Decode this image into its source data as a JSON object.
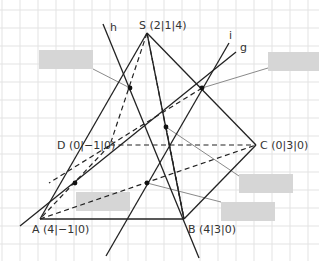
{
  "diagram": {
    "points": {
      "S": {
        "label": "S (2|1|4)",
        "x": 147,
        "y": 33
      },
      "A": {
        "label": "A (4|−1|0)",
        "x": 40,
        "y": 219
      },
      "B": {
        "label": "B (4|3|0)",
        "x": 184,
        "y": 219
      },
      "C": {
        "label": "C (0|3|0)",
        "x": 256,
        "y": 145
      },
      "D": {
        "label": "D (0|−1|0)",
        "x": 110,
        "y": 145
      }
    },
    "lines": {
      "h": {
        "label": "h"
      },
      "i": {
        "label": "i"
      },
      "g": {
        "label": "g"
      }
    },
    "answer_boxes": [
      {
        "id": "box-1",
        "text": ""
      },
      {
        "id": "box-2",
        "text": ""
      },
      {
        "id": "box-3",
        "text": ""
      },
      {
        "id": "box-4",
        "text": ""
      },
      {
        "id": "box-5",
        "text": ""
      }
    ],
    "colors": {
      "grid": "#e3e3e3",
      "line": "#222222",
      "leader": "#8a8a8a",
      "box": "#d6d6d6"
    }
  }
}
